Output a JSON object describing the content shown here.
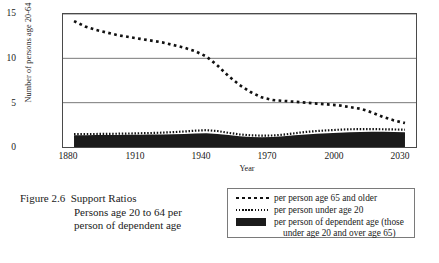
{
  "figure": {
    "number": "Figure 2.6",
    "title": "Support Ratios",
    "subtitle_line1": "Persons age 20 to 64 per",
    "subtitle_line2": "person of dependent age"
  },
  "axes": {
    "ylabel": "Number of persons age 20-64",
    "xlabel": "Year",
    "yticks": [
      "15",
      "10",
      "5",
      "0"
    ],
    "xticks": [
      "1880",
      "1910",
      "1940",
      "1970",
      "2000",
      "2030"
    ]
  },
  "legend": {
    "items": [
      {
        "marker": "coarse-dotted-line",
        "label": "per person age 65 and older",
        "label2": ""
      },
      {
        "marker": "fine-dotted-line",
        "label": "per person under age 20",
        "label2": ""
      },
      {
        "marker": "filled-black-block",
        "label": "per person of dependent age (those",
        "label2": "under age 20 and over age 65)"
      }
    ]
  },
  "colors": {
    "ink": "#1a1a1a",
    "series_black": "#1b1b1b",
    "gridline": "#777777",
    "frame": "#4a4a4a",
    "background": "#ffffff"
  },
  "chart_data": {
    "type": "line",
    "title": "Support Ratios",
    "xlabel": "Year",
    "ylabel": "Number of persons age 20-64",
    "xlim": [
      1875,
      2035
    ],
    "ylim": [
      0,
      15
    ],
    "yticks": [
      0,
      5,
      10,
      15
    ],
    "xticks": [
      1880,
      1910,
      1940,
      1970,
      2000,
      2030
    ],
    "grid": "horizontal",
    "legend_position": "below-right",
    "x": [
      1880,
      1885,
      1890,
      1895,
      1900,
      1905,
      1910,
      1915,
      1920,
      1925,
      1930,
      1935,
      1940,
      1945,
      1950,
      1955,
      1960,
      1965,
      1970,
      1975,
      1980,
      1985,
      1990,
      1995,
      2000,
      2005,
      2010,
      2015,
      2020,
      2025,
      2030
    ],
    "series": [
      {
        "name": "per person age 65 and older",
        "style": "coarse dotted",
        "values": [
          14.2,
          13.6,
          13.2,
          12.9,
          12.6,
          12.4,
          12.2,
          12.0,
          11.8,
          11.5,
          11.2,
          10.8,
          10.2,
          9.2,
          8.0,
          7.0,
          6.2,
          5.6,
          5.3,
          5.2,
          5.1,
          5.0,
          4.9,
          4.8,
          4.7,
          4.5,
          4.3,
          3.9,
          3.4,
          3.0,
          2.7
        ]
      },
      {
        "name": "per person under age 20",
        "style": "fine dotted",
        "values": [
          1.45,
          1.46,
          1.47,
          1.48,
          1.5,
          1.52,
          1.55,
          1.58,
          1.62,
          1.68,
          1.75,
          1.84,
          1.9,
          1.8,
          1.6,
          1.42,
          1.32,
          1.28,
          1.3,
          1.4,
          1.55,
          1.7,
          1.8,
          1.88,
          1.95,
          2.0,
          2.02,
          2.02,
          2.0,
          1.98,
          1.95
        ]
      },
      {
        "name": "per person of dependent age (those under age 20 and over age 65)",
        "style": "filled black area",
        "values": [
          1.32,
          1.33,
          1.34,
          1.35,
          1.36,
          1.37,
          1.38,
          1.4,
          1.42,
          1.45,
          1.48,
          1.52,
          1.55,
          1.48,
          1.35,
          1.22,
          1.14,
          1.1,
          1.12,
          1.2,
          1.32,
          1.42,
          1.5,
          1.56,
          1.62,
          1.66,
          1.7,
          1.72,
          1.72,
          1.7,
          1.66
        ]
      }
    ]
  }
}
